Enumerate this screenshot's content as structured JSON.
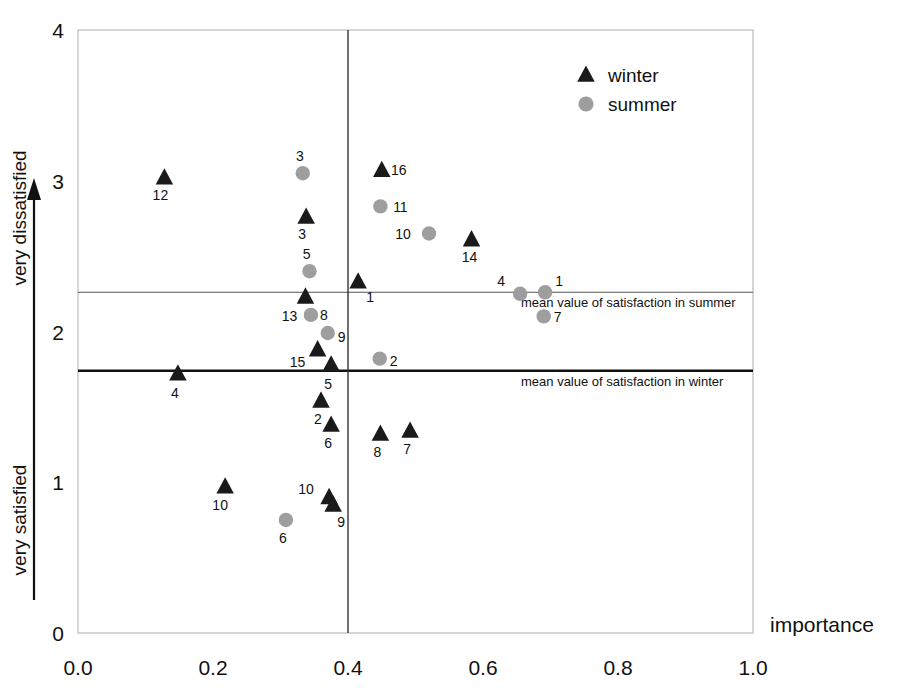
{
  "chart_data": {
    "type": "scatter",
    "title": "",
    "xlabel": "importance",
    "ylabel": "",
    "xlim": [
      0.0,
      1.0
    ],
    "ylim": [
      0,
      4
    ],
    "xticks": [
      "0.0",
      "0.2",
      "0.4",
      "0.6",
      "0.8",
      "1.0"
    ],
    "xtick_values": [
      0.0,
      0.2,
      0.4,
      0.6,
      0.8,
      1.0
    ],
    "yticks": [
      "0",
      "1",
      "2",
      "3",
      "4"
    ],
    "ytick_values": [
      0,
      1,
      2,
      3,
      4
    ],
    "y_axis_top_text": "very dissatisfied",
    "y_axis_bottom_text": "very satisfied",
    "grid": false,
    "legend_position": "top-right",
    "legend": [
      {
        "name": "winter",
        "marker": "triangle",
        "color": "#1a1a1a"
      },
      {
        "name": "summer",
        "marker": "circle",
        "color": "#9e9e9e"
      }
    ],
    "reference_lines": [
      {
        "label": "mean value of satisfaction in summer",
        "axis": "y",
        "value": 2.26,
        "style": "thin",
        "color": "#555555"
      },
      {
        "label": "mean value of satisfaction in winter",
        "axis": "y",
        "value": 1.74,
        "style": "thick",
        "color": "#111111"
      },
      {
        "label": "",
        "axis": "x",
        "value": 0.4,
        "style": "thin",
        "color": "#333333"
      }
    ],
    "series": [
      {
        "name": "winter",
        "marker": "triangle",
        "color": "#1a1a1a",
        "points": [
          {
            "label": "12",
            "x": 0.128,
            "y": 3.02,
            "lx": -4,
            "ly": 22
          },
          {
            "label": "16",
            "x": 0.45,
            "y": 3.07,
            "lx": 17,
            "ly": 5
          },
          {
            "label": "3",
            "x": 0.338,
            "y": 2.76,
            "lx": -4,
            "ly": 22
          },
          {
            "label": "14",
            "x": 0.583,
            "y": 2.61,
            "lx": -2,
            "ly": 22
          },
          {
            "label": "1",
            "x": 0.415,
            "y": 2.33,
            "lx": 12,
            "ly": 20
          },
          {
            "label": "13",
            "x": 0.337,
            "y": 2.23,
            "lx": -16,
            "ly": 24
          },
          {
            "label": "15",
            "x": 0.355,
            "y": 1.88,
            "lx": -20,
            "ly": 17
          },
          {
            "label": "5",
            "x": 0.375,
            "y": 1.78,
            "lx": -3,
            "ly": 24
          },
          {
            "label": "4",
            "x": 0.148,
            "y": 1.72,
            "lx": -3,
            "ly": 24
          },
          {
            "label": "2",
            "x": 0.36,
            "y": 1.54,
            "lx": -3,
            "ly": 23
          },
          {
            "label": "6",
            "x": 0.375,
            "y": 1.38,
            "lx": -3,
            "ly": 23
          },
          {
            "label": "8",
            "x": 0.448,
            "y": 1.32,
            "lx": -3,
            "ly": 23
          },
          {
            "label": "7",
            "x": 0.492,
            "y": 1.34,
            "lx": -3,
            "ly": 23
          },
          {
            "label": "10",
            "x": 0.218,
            "y": 0.97,
            "lx": -5,
            "ly": 23
          },
          {
            "label": "10",
            "x": 0.372,
            "y": 0.9,
            "lx": -23,
            "ly": -3
          },
          {
            "label": "9",
            "x": 0.378,
            "y": 0.85,
            "lx": 8,
            "ly": 22
          }
        ]
      },
      {
        "name": "summer",
        "marker": "circle",
        "color": "#9e9e9e",
        "points": [
          {
            "label": "3",
            "x": 0.333,
            "y": 3.05,
            "lx": -3,
            "ly": -12
          },
          {
            "label": "11",
            "x": 0.448,
            "y": 2.83,
            "lx": 20,
            "ly": 6
          },
          {
            "label": "10",
            "x": 0.52,
            "y": 2.65,
            "lx": -26,
            "ly": 5
          },
          {
            "label": "5",
            "x": 0.343,
            "y": 2.4,
            "lx": -3,
            "ly": -12
          },
          {
            "label": "8",
            "x": 0.345,
            "y": 2.11,
            "lx": 13,
            "ly": 5
          },
          {
            "label": "4",
            "x": 0.655,
            "y": 2.25,
            "lx": -19,
            "ly": -8
          },
          {
            "label": "1",
            "x": 0.692,
            "y": 2.26,
            "lx": 14,
            "ly": -6
          },
          {
            "label": "7",
            "x": 0.69,
            "y": 2.1,
            "lx": 14,
            "ly": 6
          },
          {
            "label": "9",
            "x": 0.37,
            "y": 1.99,
            "lx": 14,
            "ly": 9
          },
          {
            "label": "2",
            "x": 0.447,
            "y": 1.82,
            "lx": 14,
            "ly": 7
          },
          {
            "label": "6",
            "x": 0.308,
            "y": 0.75,
            "lx": -3,
            "ly": 23
          }
        ]
      }
    ]
  },
  "plot": {
    "frame_color": "#bbbbbb",
    "background": "#ffffff"
  }
}
